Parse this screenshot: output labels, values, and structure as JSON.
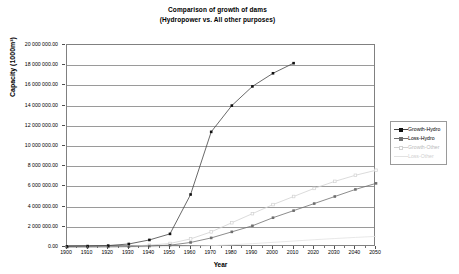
{
  "chart_data": {
    "type": "line",
    "title": "Comparison of growth of dams",
    "subtitle": "(Hydropower vs. All other purposes)",
    "xlabel": "Year",
    "ylabel": "Capacity (1000m³)",
    "xlim": [
      1900,
      2050
    ],
    "ylim": [
      0,
      20000000
    ],
    "ytick_step": 2000000,
    "xtick_step": 10,
    "grid": "horizontal",
    "legend_position": "right-outside",
    "x": [
      1900,
      1910,
      1920,
      1930,
      1940,
      1950,
      1960,
      1970,
      1980,
      1990,
      2000,
      2010,
      2020,
      2030,
      2040,
      2050
    ],
    "categories": [
      "1900",
      "1910",
      "1920",
      "1930",
      "1940",
      "1950",
      "1960",
      "1970",
      "1980",
      "1990",
      "2000",
      "2010",
      "2020",
      "2030",
      "2040",
      "2050"
    ],
    "ytick_labels": [
      "0.00",
      "2 000 000.00",
      "4 000 000.00",
      "6 000 000.00",
      "8 000 000.00",
      "10 000 000.00",
      "12 000 000.00",
      "14 000 000.00",
      "16 000 000.00",
      "18 000 000.00",
      "20 000 000.00"
    ],
    "ytick_values": [
      0,
      2000000,
      4000000,
      6000000,
      8000000,
      10000000,
      12000000,
      14000000,
      16000000,
      18000000,
      20000000
    ],
    "series": [
      {
        "name": "Growth-Hydro",
        "color": "#444444",
        "marker": "square-filled",
        "x": [
          1900,
          1910,
          1920,
          1930,
          1940,
          1950,
          1960,
          1970,
          1980,
          1990,
          2000,
          2010
        ],
        "values": [
          60000,
          90000,
          140000,
          300000,
          700000,
          1300000,
          5200000,
          11400000,
          14000000,
          15900000,
          17200000,
          18200000
        ]
      },
      {
        "name": "Loss-Hydro",
        "color": "#6e6e6e",
        "marker": "square-filled",
        "x": [
          1900,
          1910,
          1920,
          1930,
          1940,
          1950,
          1960,
          1970,
          1980,
          1990,
          2000,
          2010,
          2020,
          2030,
          2040,
          2050
        ],
        "values": [
          5000,
          10000,
          20000,
          40000,
          90000,
          180000,
          450000,
          900000,
          1500000,
          2100000,
          2900000,
          3600000,
          4300000,
          5000000,
          5700000,
          6300000
        ]
      },
      {
        "name": "Growth-Other",
        "color": "#d2d2d2",
        "marker": "square-open",
        "x": [
          1900,
          1910,
          1920,
          1930,
          1940,
          1950,
          1960,
          1970,
          1980,
          1990,
          2000,
          2010,
          2020,
          2030,
          2040,
          2050
        ],
        "values": [
          20000,
          30000,
          50000,
          90000,
          180000,
          350000,
          800000,
          1500000,
          2400000,
          3300000,
          4200000,
          5000000,
          5800000,
          6500000,
          7100000,
          7600000
        ]
      },
      {
        "name": "Loss-Other",
        "color": "#e2e2e2",
        "marker": "none",
        "x": [
          1900,
          1910,
          1920,
          1930,
          1940,
          1950,
          1960,
          1970,
          1980,
          1990,
          2000,
          2010,
          2020,
          2030,
          2040,
          2050
        ],
        "values": [
          2000,
          3000,
          5000,
          9000,
          18000,
          35000,
          70000,
          130000,
          220000,
          330000,
          460000,
          590000,
          720000,
          840000,
          950000,
          1050000
        ]
      }
    ]
  },
  "legend": {
    "items": [
      {
        "label": "Growth-Hydro"
      },
      {
        "label": "Loss-Hydro"
      },
      {
        "label": "Growth-Other"
      },
      {
        "label": "Loss-Other"
      }
    ]
  }
}
